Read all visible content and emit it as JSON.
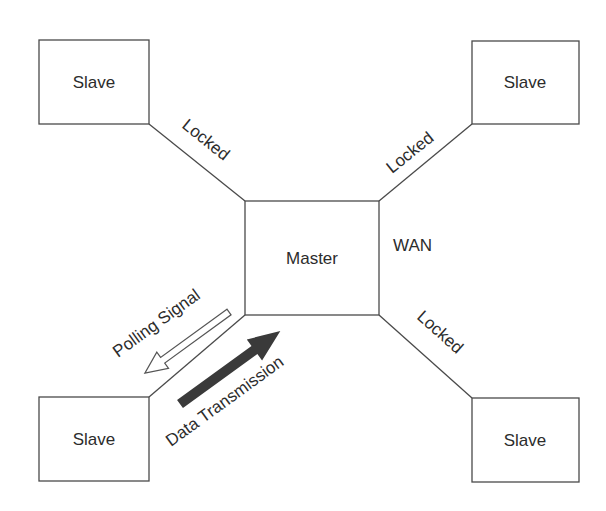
{
  "diagram": {
    "master": {
      "label": "Master"
    },
    "network_label": "WAN",
    "slaves": [
      {
        "position": "top-left",
        "label": "Slave",
        "link_label": "Locked"
      },
      {
        "position": "top-right",
        "label": "Slave",
        "link_label": "Locked"
      },
      {
        "position": "bottom-left",
        "label": "Slave"
      },
      {
        "position": "bottom-right",
        "label": "Slave",
        "link_label": "Locked"
      }
    ],
    "arrows": {
      "polling": {
        "label": "Polling Signal",
        "style": "hollow",
        "direction": "master-to-slave"
      },
      "data": {
        "label": "Data Transmission",
        "style": "filled",
        "direction": "slave-to-master",
        "color": "#3a3a3a"
      }
    }
  }
}
